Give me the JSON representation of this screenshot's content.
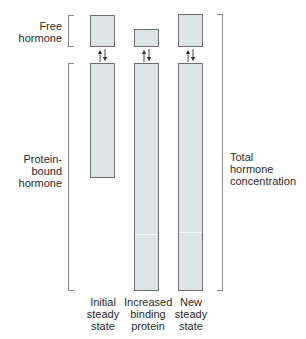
{
  "labels": {
    "free_hormone": [
      "Free",
      "hormone"
    ],
    "protein_bound": [
      "Protein-",
      "bound",
      "hormone"
    ],
    "total": [
      "Total",
      "hormone",
      "concentration"
    ]
  },
  "columns": [
    {
      "label": [
        "Initial",
        "steady",
        "state"
      ],
      "free_level": "normal",
      "bound_level": "normal"
    },
    {
      "label": [
        "Increased",
        "binding",
        "protein"
      ],
      "free_level": "decreased",
      "bound_level": "increased"
    },
    {
      "label": [
        "New",
        "steady",
        "state"
      ],
      "free_level": "normal",
      "bound_level": "increased"
    }
  ],
  "colors": {
    "box_fill": "#dde4e6",
    "box_border": "#6f6f6f",
    "bracket": "#8a8a8a",
    "text": "#2a2a2a"
  }
}
